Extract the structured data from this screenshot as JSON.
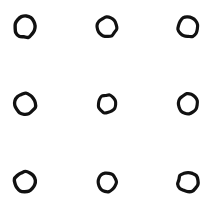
{
  "figure": {
    "kind": "nine-dot-grid",
    "title": "Nine circles arranged in a 3 by 3 grid",
    "width": 220,
    "height": 212,
    "background_color": "#ffffff",
    "stroke_color": "#111111",
    "rows": 3,
    "columns": 3,
    "column_centers_x": [
      25,
      107,
      188
    ],
    "row_centers_y": [
      27,
      104,
      182
    ],
    "marks": [
      {
        "id": "circle-r1-c1",
        "row": 1,
        "column": 1,
        "cx": 25,
        "cy": 27,
        "rx": 10.5,
        "ry": 10.5,
        "stroke_width": 3.4,
        "rotation": -6,
        "label": "top left circle"
      },
      {
        "id": "circle-r1-c2",
        "row": 1,
        "column": 2,
        "cx": 107,
        "cy": 27,
        "rx": 9.6,
        "ry": 9.6,
        "stroke_width": 3.2,
        "rotation": 10,
        "label": "top center circle"
      },
      {
        "id": "circle-r1-c3",
        "row": 1,
        "column": 3,
        "cx": 188,
        "cy": 27,
        "rx": 10.0,
        "ry": 10.0,
        "stroke_width": 3.2,
        "rotation": -14,
        "label": "top right circle"
      },
      {
        "id": "circle-r2-c1",
        "row": 2,
        "column": 1,
        "cx": 25,
        "cy": 104,
        "rx": 10.4,
        "ry": 10.4,
        "stroke_width": 3.3,
        "rotation": 18,
        "label": "middle left circle"
      },
      {
        "id": "circle-r2-c2",
        "row": 2,
        "column": 2,
        "cx": 107,
        "cy": 104,
        "rx": 9.0,
        "ry": 9.0,
        "stroke_width": 3.1,
        "rotation": -22,
        "label": "middle center circle"
      },
      {
        "id": "circle-r2-c3",
        "row": 2,
        "column": 3,
        "cx": 188,
        "cy": 104,
        "rx": 9.8,
        "ry": 9.8,
        "stroke_width": 3.2,
        "rotation": 6,
        "label": "middle right circle"
      },
      {
        "id": "circle-r3-c1",
        "row": 3,
        "column": 1,
        "cx": 25,
        "cy": 182,
        "rx": 10.4,
        "ry": 10.4,
        "stroke_width": 3.4,
        "rotation": -10,
        "label": "bottom left circle"
      },
      {
        "id": "circle-r3-c2",
        "row": 3,
        "column": 2,
        "cx": 107,
        "cy": 182,
        "rx": 9.4,
        "ry": 9.4,
        "stroke_width": 3.2,
        "rotation": 26,
        "label": "bottom center circle"
      },
      {
        "id": "circle-r3-c3",
        "row": 3,
        "column": 3,
        "cx": 188,
        "cy": 182,
        "rx": 10.0,
        "ry": 10.0,
        "stroke_width": 3.3,
        "rotation": 14,
        "label": "bottom right circle"
      }
    ]
  }
}
